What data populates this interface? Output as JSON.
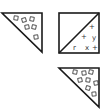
{
  "diagram": {
    "background": "#ffffff",
    "stroke_color": "#1a1a1a",
    "shapes": [
      {
        "id": "triangle-top-left",
        "kind": "right-triangle",
        "points": "2,13 42,13 42,52",
        "fill_marks": "squares"
      },
      {
        "id": "square-top-right",
        "kind": "square-with-diagonal",
        "rect": {
          "x": 59,
          "y": 13,
          "w": 40,
          "h": 40
        },
        "diagonal": {
          "x1": 59,
          "y1": 53,
          "x2": 99,
          "y2": 13
        },
        "marks": [
          {
            "glyph": "+",
            "x": 92,
            "y": 27
          },
          {
            "glyph": "+",
            "x": 84,
            "y": 37
          },
          {
            "glyph": "y",
            "x": 93,
            "y": 39
          },
          {
            "glyph": "r",
            "x": 75,
            "y": 49
          },
          {
            "glyph": "x",
            "x": 87,
            "y": 49
          },
          {
            "glyph": "+",
            "x": 95,
            "y": 49
          }
        ]
      },
      {
        "id": "triangle-bottom-right",
        "kind": "right-triangle",
        "points": "59,68 99,68 99,107",
        "fill_marks": "squares"
      }
    ]
  }
}
